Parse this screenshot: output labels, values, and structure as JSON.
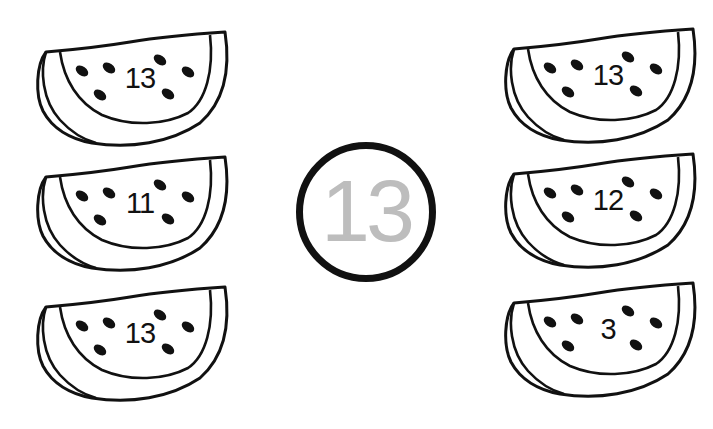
{
  "worksheet": {
    "title": "Find the number",
    "target": {
      "value": "13",
      "circle_color": "#111111",
      "number_color": "#bdbdbd"
    },
    "left_column": [
      {
        "value": "13"
      },
      {
        "value": "11"
      },
      {
        "value": "13"
      }
    ],
    "right_column": [
      {
        "value": "13"
      },
      {
        "value": "12"
      },
      {
        "value": "3"
      }
    ],
    "icons": {
      "slice": "watermelon-slice-icon",
      "seed": "seed-icon"
    },
    "colors": {
      "outline": "#111111",
      "background": "#ffffff"
    }
  }
}
